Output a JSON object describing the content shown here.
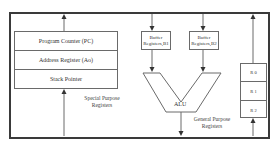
{
  "diagram": {
    "title": "",
    "special_purpose": {
      "registers": [
        {
          "label": "Program Counter (PC)"
        },
        {
          "label": "Address Register (Ao)"
        },
        {
          "label": "Stack Pointer"
        }
      ],
      "group_label_line1": "Special Purpose",
      "group_label_line2": "Registers"
    },
    "buffers": [
      {
        "line1": "Buffer",
        "line2": "Registers,B1"
      },
      {
        "line1": "Buffer",
        "line2": "Registers,B2"
      }
    ],
    "alu": {
      "label": "ALU"
    },
    "general_purpose": {
      "registers": [
        {
          "label": "R 0"
        },
        {
          "label": "R 1"
        },
        {
          "label": "R 2"
        }
      ],
      "group_label_line1": "General Purpose",
      "group_label_line2": "Registers"
    },
    "colors": {
      "frame": "#3a3a3a",
      "lines": "#6a6a6a",
      "text": "#333333",
      "background": "#ffffff"
    }
  }
}
